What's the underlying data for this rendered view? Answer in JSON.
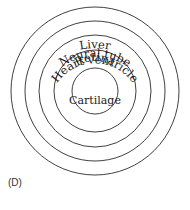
{
  "diagram": {
    "type": "concentric-circles",
    "center": {
      "x": 95,
      "y": 91
    },
    "rings": [
      {
        "label": "Liver",
        "radius": 84
      },
      {
        "label": "Neural tube",
        "radius": 70
      },
      {
        "label": "Heart ventricle",
        "radius": 56
      },
      {
        "label": "Retina",
        "radius": 41
      },
      {
        "label": "Cartilage",
        "radius": 23
      }
    ],
    "panel_label": "(D)"
  }
}
